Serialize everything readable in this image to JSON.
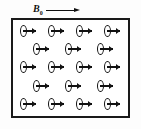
{
  "figure": {
    "background_color": "#fdfdfd",
    "ink_color": "#111111"
  },
  "field_label": {
    "symbol": "B",
    "subscript": "0",
    "arrow_direction": "right",
    "arrow_name": "external-field-arrow"
  },
  "sample_box": {
    "border_color": "#1a1a1a",
    "fill_color": "#ffffff"
  },
  "dipole": {
    "glyph_name": "magnetic-dipole-symbol",
    "description": "current loop with magnetic moment arrow pointing right"
  },
  "lattice": {
    "rows": [
      {
        "type": "full",
        "count": 4
      },
      {
        "type": "offset",
        "count": 3
      },
      {
        "type": "full",
        "count": 4
      },
      {
        "type": "offset",
        "count": 3
      },
      {
        "type": "full",
        "count": 4
      }
    ]
  }
}
